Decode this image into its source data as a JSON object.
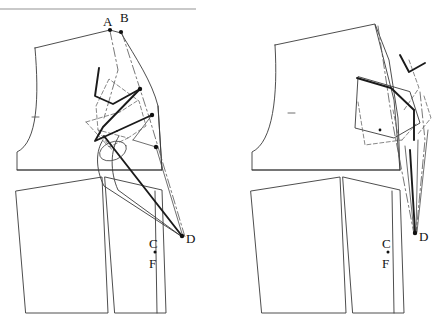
{
  "document": {
    "title": "Pattern block dart rotation diagram",
    "kind": "technical-line-drawing"
  },
  "top_rule": {
    "present": true,
    "color": "#c9c9c9",
    "x_start": 0,
    "x_end": 196,
    "y": 9
  },
  "figures": [
    {
      "id": "left-figure",
      "name": "original-block-with-dart-construction",
      "labels": [
        {
          "id": "A",
          "text": "A",
          "x": 107,
          "y": 22
        },
        {
          "id": "B",
          "text": "B",
          "x": 124,
          "y": 18
        },
        {
          "id": "C",
          "text": "C",
          "x": 152,
          "y": 243
        },
        {
          "id": "F",
          "text": "F",
          "x": 152,
          "y": 263
        },
        {
          "id": "D",
          "text": "D",
          "x": 183,
          "y": 239
        }
      ],
      "point_marker": {
        "between": [
          "C",
          "F"
        ],
        "x": 155,
        "y": 252
      }
    },
    {
      "id": "right-figure",
      "name": "rotated-block-dart-closed",
      "labels": [
        {
          "id": "C",
          "text": "C",
          "x": 385,
          "y": 243
        },
        {
          "id": "F",
          "text": "F",
          "x": 385,
          "y": 263
        },
        {
          "id": "D",
          "text": "D",
          "x": 416,
          "y": 237
        }
      ],
      "point_marker": {
        "between": [
          "C",
          "F"
        ],
        "x": 388,
        "y": 252
      }
    }
  ],
  "styles": {
    "outline_color": "#3a3a3a",
    "construction_color": "#555555",
    "dashed_color": "#666666",
    "bold_color": "#1a1a1a",
    "marker_color": "#111111",
    "outline_width": 0.9,
    "bold_width": 1.9
  },
  "notes": {
    "line_types": [
      "solid outline",
      "dash-dot construction",
      "dashed dart legs",
      "bold dart legs",
      "tapered dart to point D"
    ]
  }
}
